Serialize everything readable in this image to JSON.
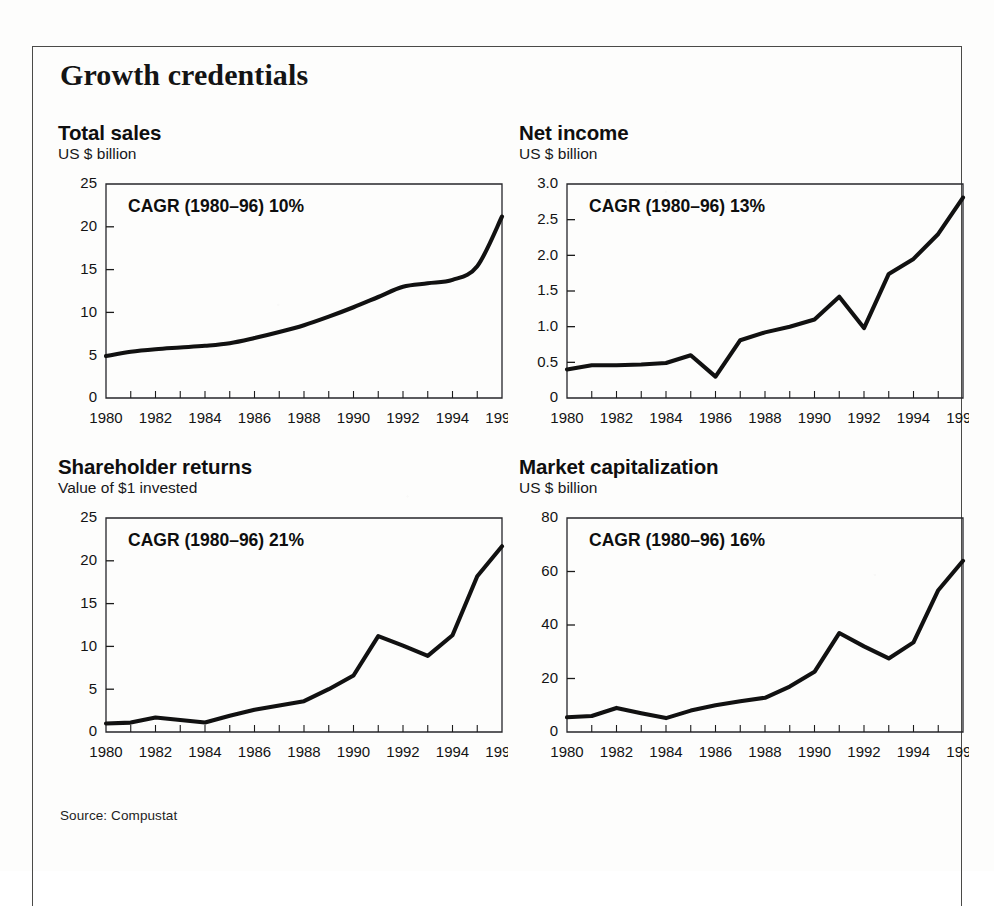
{
  "figure": {
    "headline": "Growth credentials",
    "source_note": "Source: Compustat",
    "frame_color": "#4a4a48",
    "line_color": "#111111",
    "background": "#fdfdfc"
  },
  "chart_data": [
    {
      "type": "line",
      "panel_id": "total-sales",
      "title": "Total sales",
      "subtitle": "US $ billion",
      "annotation": "CAGR (1980–96) 10%",
      "xlabel": "",
      "ylabel": "US $ billion",
      "x": [
        1980,
        1981,
        1982,
        1983,
        1984,
        1985,
        1986,
        1987,
        1988,
        1989,
        1990,
        1991,
        1992,
        1993,
        1994,
        1995,
        1996
      ],
      "values": [
        4.9,
        5.4,
        5.7,
        5.9,
        6.1,
        6.4,
        7.0,
        7.7,
        8.5,
        9.5,
        10.6,
        11.8,
        13.0,
        13.4,
        13.8,
        15.4,
        21.2
      ],
      "categories": [
        "1980",
        "1981",
        "1982",
        "1983",
        "1984",
        "1985",
        "1986",
        "1987",
        "1988",
        "1989",
        "1990",
        "1991",
        "1992",
        "1993",
        "1994",
        "1995",
        "1996"
      ],
      "ylim": [
        0,
        25
      ],
      "yticks": [
        0,
        5,
        10,
        15,
        20,
        25
      ],
      "ytick_labels": [
        "0",
        "5",
        "10",
        "15",
        "20",
        "25"
      ],
      "xlim": [
        1980,
        1996
      ],
      "xticks": [
        1980,
        1981,
        1982,
        1983,
        1984,
        1985,
        1986,
        1987,
        1988,
        1989,
        1990,
        1991,
        1992,
        1993,
        1994,
        1995,
        1996
      ],
      "xtick_labels": [
        "1980",
        "",
        "1982",
        "",
        "1984",
        "",
        "1986",
        "",
        "1988",
        "",
        "1990",
        "",
        "1992",
        "",
        "1994",
        "",
        "1996"
      ],
      "grid": false,
      "legend": "none",
      "smooth": true
    },
    {
      "type": "line",
      "panel_id": "net-income",
      "title": "Net income",
      "subtitle": "US $ billion",
      "annotation": "CAGR (1980–96) 13%",
      "xlabel": "",
      "ylabel": "US $ billion",
      "x": [
        1980,
        1981,
        1982,
        1983,
        1984,
        1985,
        1986,
        1987,
        1988,
        1989,
        1990,
        1991,
        1992,
        1993,
        1994,
        1995,
        1996
      ],
      "values": [
        0.4,
        0.46,
        0.46,
        0.47,
        0.49,
        0.6,
        0.3,
        0.81,
        0.92,
        1.0,
        1.1,
        1.42,
        0.98,
        1.74,
        1.95,
        2.3,
        2.81
      ],
      "categories": [
        "1980",
        "1981",
        "1982",
        "1983",
        "1984",
        "1985",
        "1986",
        "1987",
        "1988",
        "1989",
        "1990",
        "1991",
        "1992",
        "1993",
        "1994",
        "1995",
        "1996"
      ],
      "ylim": [
        0,
        3.0
      ],
      "yticks": [
        0,
        0.5,
        1.0,
        1.5,
        2.0,
        2.5,
        3.0
      ],
      "ytick_labels": [
        "0",
        "0.5",
        "1.0",
        "1.5",
        "2.0",
        "2.5",
        "3.0"
      ],
      "xlim": [
        1980,
        1996
      ],
      "xticks": [
        1980,
        1981,
        1982,
        1983,
        1984,
        1985,
        1986,
        1987,
        1988,
        1989,
        1990,
        1991,
        1992,
        1993,
        1994,
        1995,
        1996
      ],
      "xtick_labels": [
        "1980",
        "",
        "1982",
        "",
        "1984",
        "",
        "1986",
        "",
        "1988",
        "",
        "1990",
        "",
        "1992",
        "",
        "1994",
        "",
        "1996"
      ],
      "grid": false,
      "legend": "none",
      "smooth": false
    },
    {
      "type": "line",
      "panel_id": "shareholder-returns",
      "title": "Shareholder returns",
      "subtitle": "Value of $1 invested",
      "annotation": "CAGR (1980–96) 21%",
      "xlabel": "",
      "ylabel": "Value of $1 invested",
      "x": [
        1980,
        1981,
        1982,
        1983,
        1984,
        1985,
        1986,
        1987,
        1988,
        1989,
        1990,
        1991,
        1992,
        1993,
        1994,
        1995,
        1996
      ],
      "values": [
        1.0,
        1.1,
        1.7,
        1.4,
        1.1,
        1.9,
        2.6,
        3.1,
        3.6,
        5.0,
        6.6,
        11.2,
        10.1,
        8.9,
        11.3,
        18.2,
        21.7
      ],
      "categories": [
        "1980",
        "1981",
        "1982",
        "1983",
        "1984",
        "1985",
        "1986",
        "1987",
        "1988",
        "1989",
        "1990",
        "1991",
        "1992",
        "1993",
        "1994",
        "1995",
        "1996"
      ],
      "ylim": [
        0,
        25
      ],
      "yticks": [
        0,
        5,
        10,
        15,
        20,
        25
      ],
      "ytick_labels": [
        "0",
        "5",
        "10",
        "15",
        "20",
        "25"
      ],
      "xlim": [
        1980,
        1996
      ],
      "xticks": [
        1980,
        1981,
        1982,
        1983,
        1984,
        1985,
        1986,
        1987,
        1988,
        1989,
        1990,
        1991,
        1992,
        1993,
        1994,
        1995,
        1996
      ],
      "xtick_labels": [
        "1980",
        "",
        "1982",
        "",
        "1984",
        "",
        "1986",
        "",
        "1988",
        "",
        "1990",
        "",
        "1992",
        "",
        "1994",
        "",
        "1996"
      ],
      "grid": false,
      "legend": "none",
      "smooth": false
    },
    {
      "type": "line",
      "panel_id": "market-capitalization",
      "title": "Market capitalization",
      "subtitle": "US $ billion",
      "annotation": "CAGR (1980–96) 16%",
      "xlabel": "",
      "ylabel": "US $ billion",
      "x": [
        1980,
        1981,
        1982,
        1983,
        1984,
        1985,
        1986,
        1987,
        1988,
        1989,
        1990,
        1991,
        1992,
        1993,
        1994,
        1995,
        1996
      ],
      "values": [
        5.5,
        6.0,
        9.0,
        7.0,
        5.2,
        8.0,
        10.0,
        11.5,
        12.8,
        17.0,
        22.5,
        37.0,
        32.0,
        27.5,
        33.5,
        53.0,
        64.0
      ],
      "categories": [
        "1980",
        "1981",
        "1982",
        "1983",
        "1984",
        "1985",
        "1986",
        "1987",
        "1988",
        "1989",
        "1990",
        "1991",
        "1992",
        "1993",
        "1994",
        "1995",
        "1996"
      ],
      "ylim": [
        0,
        80
      ],
      "yticks": [
        0,
        20,
        40,
        60,
        80
      ],
      "ytick_labels": [
        "0",
        "20",
        "40",
        "60",
        "80"
      ],
      "xlim": [
        1980,
        1996
      ],
      "xticks": [
        1980,
        1981,
        1982,
        1983,
        1984,
        1985,
        1986,
        1987,
        1988,
        1989,
        1990,
        1991,
        1992,
        1993,
        1994,
        1995,
        1996
      ],
      "xtick_labels": [
        "1980",
        "",
        "1982",
        "",
        "1984",
        "",
        "1986",
        "",
        "1988",
        "",
        "1990",
        "",
        "1992",
        "",
        "1994",
        "",
        "1996"
      ],
      "grid": false,
      "legend": "none",
      "smooth": false
    }
  ]
}
